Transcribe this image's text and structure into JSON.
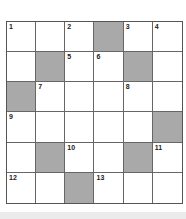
{
  "puzzle": {
    "rows": 6,
    "cols": 6,
    "colors": {
      "block": "#a9a9a9",
      "cell": "#ffffff",
      "border": "#666666"
    },
    "cells": [
      [
        {
          "n": "1"
        },
        {
          "n": ""
        },
        {
          "n": "2"
        },
        {
          "block": true
        },
        {
          "n": "3"
        },
        {
          "n": "4"
        }
      ],
      [
        {
          "n": ""
        },
        {
          "block": true
        },
        {
          "n": "5"
        },
        {
          "n": "6"
        },
        {
          "block": true
        },
        {
          "n": ""
        }
      ],
      [
        {
          "block": true
        },
        {
          "n": "7"
        },
        {
          "n": ""
        },
        {
          "n": ""
        },
        {
          "n": "8"
        },
        {
          "n": ""
        }
      ],
      [
        {
          "n": "9"
        },
        {
          "n": ""
        },
        {
          "n": ""
        },
        {
          "n": ""
        },
        {
          "n": ""
        },
        {
          "block": true
        }
      ],
      [
        {
          "n": ""
        },
        {
          "block": true
        },
        {
          "n": "10"
        },
        {
          "n": ""
        },
        {
          "block": true
        },
        {
          "n": "11"
        }
      ],
      [
        {
          "n": "12"
        },
        {
          "n": ""
        },
        {
          "block": true
        },
        {
          "n": "13"
        },
        {
          "n": ""
        },
        {
          "n": ""
        }
      ]
    ]
  }
}
